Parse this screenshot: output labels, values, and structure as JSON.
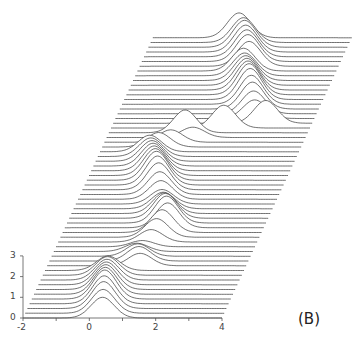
{
  "chart_data": {
    "type": "line",
    "subtype": "waterfall",
    "title": "",
    "panel_label": "(B)",
    "xlabel": "",
    "ylabel": "",
    "xlim": [
      -2,
      4
    ],
    "ylim": [
      0,
      3
    ],
    "x_ticks": [
      -2,
      -1,
      0,
      1,
      2,
      3,
      4
    ],
    "x_tick_labels": [
      "-2",
      "",
      "0",
      "",
      "2",
      "",
      "4"
    ],
    "y_ticks": [
      0,
      1,
      2,
      3
    ],
    "y_tick_labels": [
      "0",
      "1",
      "2",
      "3"
    ],
    "grid": false,
    "legend": null,
    "trace_count": 60,
    "trace_offset_px": {
      "dx": 2.2,
      "dy": -4.75
    },
    "sigma": 0.35,
    "series": [
      {
        "mean": 0.4,
        "amp": 1.0
      },
      {
        "mean": 0.35,
        "amp": 1.15
      },
      {
        "mean": 0.3,
        "amp": 1.3
      },
      {
        "mean": 0.25,
        "amp": 1.35
      },
      {
        "mean": 0.2,
        "amp": 1.4
      },
      {
        "mean": 0.15,
        "amp": 1.3
      },
      {
        "mean": 0.1,
        "amp": 1.2
      },
      {
        "mean": 0.05,
        "amp": 1.1
      },
      {
        "mean": 0.0,
        "amp": 1.0
      },
      {
        "mean": -0.05,
        "amp": 0.9
      },
      {
        "mean": -0.1,
        "amp": 0.7
      },
      {
        "mean": 0.8,
        "amp": 0.6
      },
      {
        "mean": 0.7,
        "amp": 0.7
      },
      {
        "mean": 0.6,
        "amp": 0.6
      },
      {
        "mean": 0.5,
        "amp": 0.4
      },
      {
        "mean": 0.6,
        "amp": 0.3
      },
      {
        "mean": 0.8,
        "amp": 0.6
      },
      {
        "mean": 0.9,
        "amp": 0.9
      },
      {
        "mean": 1.0,
        "amp": 1.1
      },
      {
        "mean": 1.1,
        "amp": 1.2
      },
      {
        "mean": 1.0,
        "amp": 1.3
      },
      {
        "mean": 0.9,
        "amp": 1.2
      },
      {
        "mean": 0.8,
        "amp": 1.0
      },
      {
        "mean": 0.7,
        "amp": 0.8
      },
      {
        "mean": 0.6,
        "amp": 0.7
      },
      {
        "mean": 0.5,
        "amp": 0.9
      },
      {
        "mean": 0.4,
        "amp": 1.1
      },
      {
        "mean": 0.3,
        "amp": 1.3
      },
      {
        "mean": 0.2,
        "amp": 1.4
      },
      {
        "mean": 0.1,
        "amp": 1.4
      },
      {
        "mean": 0.0,
        "amp": 1.3
      },
      {
        "mean": -0.1,
        "amp": 1.2
      },
      {
        "mean": -0.2,
        "amp": 1.1
      },
      {
        "mean": -0.3,
        "amp": 1.0
      },
      {
        "mean": -0.4,
        "amp": 0.9
      },
      {
        "mean": -0.5,
        "amp": 0.8
      },
      {
        "mean": -0.3,
        "amp": 0.7
      },
      {
        "mean": 0.0,
        "amp": 0.6
      },
      {
        "mean": 0.6,
        "amp": 0.5
      },
      {
        "mean": 0.3,
        "amp": 1.1
      },
      {
        "mean": 1.4,
        "amp": 1.1
      },
      {
        "mean": 2.6,
        "amp": 1.1
      },
      {
        "mean": 2.2,
        "amp": 0.9
      },
      {
        "mean": 2.1,
        "amp": 1.1
      },
      {
        "mean": 2.0,
        "amp": 1.3
      },
      {
        "mean": 1.9,
        "amp": 1.4
      },
      {
        "mean": 1.8,
        "amp": 1.5
      },
      {
        "mean": 1.7,
        "amp": 1.5
      },
      {
        "mean": 1.6,
        "amp": 1.4
      },
      {
        "mean": 1.5,
        "amp": 1.3
      },
      {
        "mean": 1.4,
        "amp": 1.2
      },
      {
        "mean": 1.3,
        "amp": 1.1
      },
      {
        "mean": 1.2,
        "amp": 1.1
      },
      {
        "mean": 1.3,
        "amp": 1.2
      },
      {
        "mean": 1.2,
        "amp": 1.3
      },
      {
        "mean": 1.1,
        "amp": 1.3
      },
      {
        "mean": 1.0,
        "amp": 1.3
      },
      {
        "mean": 0.9,
        "amp": 1.3
      },
      {
        "mean": 0.8,
        "amp": 1.2
      },
      {
        "mean": 0.6,
        "amp": 1.2
      }
    ]
  }
}
